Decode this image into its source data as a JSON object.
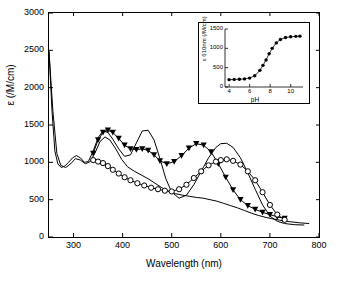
{
  "chart_data": {
    "type": "line",
    "title": "",
    "xlabel": "Wavelength (nm)",
    "ylabel": "ε (/M/cm)",
    "xlim": [
      250,
      800
    ],
    "ylim": [
      0,
      3000
    ],
    "xticks": [
      300,
      400,
      500,
      600,
      700,
      800
    ],
    "xtick_labels": [
      "300",
      "400",
      "500",
      "600",
      "700",
      "800"
    ],
    "yticks": [
      0,
      500,
      1000,
      1500,
      2000,
      2500,
      3000
    ],
    "ytick_labels": [
      "0",
      "500",
      "1000",
      "1500",
      "2000",
      "2500",
      "3000"
    ],
    "grid": false,
    "legend": "none",
    "series": [
      {
        "name": "plain-curve-1",
        "marker": "none",
        "x": [
          250,
          256,
          262,
          268,
          275,
          282,
          290,
          298,
          306,
          314,
          322,
          330,
          340,
          350,
          360,
          370,
          380,
          392,
          404,
          416,
          428,
          440,
          452,
          464,
          476,
          488,
          500,
          515,
          530,
          545,
          560,
          575,
          590,
          600,
          612,
          625,
          640,
          655,
          670,
          685,
          700,
          715,
          730,
          750,
          770
        ],
        "y": [
          2500,
          1700,
          1150,
          980,
          930,
          950,
          1000,
          1060,
          1090,
          1060,
          1000,
          1010,
          1150,
          1330,
          1420,
          1400,
          1310,
          1180,
          1080,
          1100,
          1260,
          1420,
          1430,
          1300,
          1050,
          780,
          600,
          520,
          560,
          700,
          880,
          1060,
          1200,
          1250,
          1255,
          1200,
          1060,
          860,
          640,
          430,
          280,
          210,
          180,
          165,
          160
        ]
      },
      {
        "name": "plain-curve-2",
        "marker": "none",
        "x": [
          250,
          258,
          266,
          274,
          284,
          294,
          304,
          314,
          324,
          334,
          344,
          354,
          364,
          374,
          386,
          398,
          410,
          424,
          438,
          452,
          466,
          480,
          494,
          508,
          522,
          536,
          550,
          564,
          578,
          592,
          606,
          620,
          634,
          648,
          662,
          676,
          690,
          704,
          720,
          740,
          760,
          780
        ],
        "y": [
          2480,
          1680,
          1120,
          960,
          930,
          980,
          1050,
          1030,
          980,
          1010,
          1130,
          1280,
          1340,
          1300,
          1180,
          1040,
          940,
          880,
          830,
          780,
          720,
          660,
          610,
          580,
          560,
          545,
          530,
          520,
          500,
          480,
          450,
          420,
          390,
          355,
          320,
          290,
          265,
          245,
          225,
          205,
          190,
          180
        ]
      },
      {
        "name": "filled-triangle-series",
        "marker": "filled-triangle",
        "x": [
          340,
          350,
          360,
          370,
          380,
          392,
          404,
          416,
          428,
          440,
          452,
          464,
          476,
          490,
          505,
          520,
          535,
          550,
          565,
          580,
          595,
          610,
          625,
          640,
          655,
          670,
          685,
          700,
          715,
          730
        ],
        "y": [
          1120,
          1300,
          1400,
          1430,
          1400,
          1320,
          1230,
          1180,
          1170,
          1180,
          1160,
          1100,
          1020,
          980,
          1010,
          1090,
          1190,
          1250,
          1230,
          1140,
          980,
          800,
          630,
          500,
          420,
          370,
          330,
          300,
          270,
          250
        ]
      },
      {
        "name": "open-circle-series",
        "marker": "open-circle",
        "x": [
          340,
          350,
          360,
          370,
          380,
          392,
          404,
          416,
          430,
          444,
          458,
          472,
          486,
          500,
          515,
          530,
          545,
          560,
          575,
          590,
          600,
          612,
          625,
          640,
          655,
          670,
          685,
          700,
          715,
          730
        ],
        "y": [
          1030,
          1010,
          990,
          950,
          900,
          850,
          800,
          760,
          720,
          690,
          660,
          640,
          620,
          610,
          640,
          700,
          790,
          880,
          960,
          1010,
          1030,
          1040,
          1020,
          970,
          880,
          760,
          600,
          430,
          300,
          230
        ]
      }
    ],
    "inset": {
      "type": "scatter-line",
      "xlabel": "pH",
      "ylabel": "ε 610nm (/M/cm)",
      "xlim": [
        3.6,
        11.2
      ],
      "ylim": [
        0,
        1500
      ],
      "xticks": [
        4,
        6,
        8,
        10
      ],
      "xtick_labels": [
        "4",
        "6",
        "8",
        "10"
      ],
      "yticks": [
        0,
        500,
        1000,
        1500
      ],
      "ytick_labels": [
        "0",
        "500",
        "1000",
        "1500"
      ],
      "marker": "filled-circle",
      "x": [
        4.0,
        4.5,
        5.0,
        5.5,
        6.0,
        6.5,
        7.0,
        7.3,
        7.6,
        7.9,
        8.2,
        8.6,
        9.0,
        9.5,
        10.0,
        10.5,
        10.9
      ],
      "y": [
        190,
        195,
        200,
        210,
        230,
        290,
        430,
        560,
        700,
        860,
        1000,
        1140,
        1230,
        1280,
        1300,
        1310,
        1315
      ]
    }
  }
}
